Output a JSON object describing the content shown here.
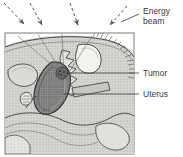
{
  "figure": {
    "kind": "medical-illustration",
    "background_color": "#ffffff",
    "frame": {
      "x": 5,
      "y": 33,
      "width": 129,
      "height": 121,
      "border_color": "#6d6d6d"
    }
  },
  "labels": [
    {
      "id": "energy-beam",
      "text_line1": "Energy",
      "text_line2": "beam",
      "x": 143,
      "y": 12,
      "leader": {
        "x1": 139,
        "y1": 14,
        "x2": 121,
        "y2": 22
      },
      "color": "#3a3a3a"
    },
    {
      "id": "tumor",
      "text_line1": "Tumor",
      "text_line2": "",
      "x": 143,
      "y": 75,
      "leader": {
        "x1": 139,
        "y1": 73,
        "x2": 66,
        "y2": 73
      },
      "color": "#3a3a3a"
    },
    {
      "id": "uterus",
      "text_line1": "Uterus",
      "text_line2": "",
      "x": 143,
      "y": 97,
      "leader": {
        "x1": 139,
        "y1": 94,
        "x2": 63,
        "y2": 94
      },
      "color": "#3a3a3a"
    }
  ],
  "beam_arrows": [
    {
      "id": "arrow-1",
      "x1": 4,
      "y1": 3,
      "x2": 24,
      "y2": 24
    },
    {
      "id": "arrow-2",
      "x1": 30,
      "y1": 3,
      "x2": 42,
      "y2": 25
    },
    {
      "id": "arrow-3",
      "x1": 70,
      "y1": 3,
      "x2": 78,
      "y2": 25
    },
    {
      "id": "arrow-4",
      "x1": 127,
      "y1": 6,
      "x2": 110,
      "y2": 25
    }
  ],
  "internal_beams": [
    {
      "id": "beam-path-1",
      "x1": 18,
      "y1": 36,
      "x2": 62,
      "y2": 74
    },
    {
      "id": "beam-path-2",
      "x1": 38,
      "y1": 34,
      "x2": 63,
      "y2": 74
    },
    {
      "id": "beam-path-3",
      "x1": 62,
      "y1": 34,
      "x2": 64,
      "y2": 74
    },
    {
      "id": "beam-path-4",
      "x1": 92,
      "y1": 36,
      "x2": 68,
      "y2": 74
    }
  ],
  "anatomy": {
    "tumor_spot": {
      "cx": 62,
      "cy": 73,
      "r": 6,
      "fill": "#5a5a5a"
    },
    "uterus": {
      "fill": "#8c8c8c",
      "stroke": "#3a3a3a"
    },
    "bladder": {
      "fill": "#f2f0ec",
      "stroke": "#4a4a4a"
    },
    "sacrum": {
      "fill": "#e8e6e2",
      "stroke": "#3a3a3a"
    },
    "body_fill": "#d8d6d2",
    "tissue_fill": "#cfcdc9",
    "outline_color": "#3a3a3a"
  }
}
